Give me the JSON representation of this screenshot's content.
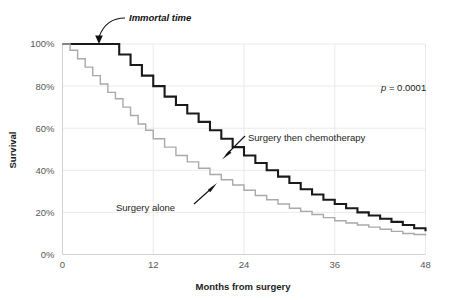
{
  "chart_data": {
    "type": "line",
    "subtype": "kaplan-meier-step",
    "title": "",
    "xlabel": "Months from surgery",
    "ylabel": "Survival",
    "xlim": [
      0,
      48
    ],
    "ylim": [
      0,
      100
    ],
    "xticks": [
      0,
      12,
      24,
      36,
      48
    ],
    "xtick_labels": [
      "0",
      "12",
      "24",
      "36",
      "48"
    ],
    "yticks": [
      0,
      20,
      40,
      60,
      80,
      100
    ],
    "ytick_labels": [
      "0%",
      "20%",
      "40%",
      "60%",
      "80%",
      "100%"
    ],
    "grid": true,
    "grid_color": "#e8e8e8",
    "legend_position": "inline-annotations",
    "annotations": [
      {
        "name": "immortal-time",
        "text": "Immortal time",
        "style": "bold-italic",
        "points_to_x": 3.2,
        "points_to_y": 100
      },
      {
        "name": "p-value",
        "text_italic": "p",
        "text_rest": " = 0.0001",
        "text_full": "p = 0.0001",
        "x": 36.5,
        "y": 84
      },
      {
        "name": "surgery-then-chemotherapy-label",
        "text": "Surgery then chemotherapy",
        "points_to_x": 20.5,
        "points_to_y": 47
      },
      {
        "name": "surgery-alone-label",
        "text": "Surgery alone",
        "points_to_x": 20.2,
        "points_to_y": 34
      }
    ],
    "series": [
      {
        "name": "Surgery then chemotherapy",
        "color": "#1a1a1a",
        "line_width": 2.1,
        "immortal_time_months": 6.5,
        "x": [
          0,
          1,
          2,
          3,
          4,
          5,
          6,
          6.5,
          7.5,
          9,
          10.5,
          12,
          13.5,
          15,
          16.5,
          18,
          19.5,
          21,
          22.5,
          24,
          25.5,
          27,
          28.5,
          30,
          31.5,
          33,
          34.5,
          36,
          37.5,
          39,
          40.5,
          42,
          43.5,
          45,
          46.5,
          48
        ],
        "values": [
          100,
          100,
          100,
          100,
          100,
          100,
          100,
          100,
          95,
          90,
          85,
          80,
          75,
          71,
          67,
          63,
          59,
          55,
          51,
          47,
          43.5,
          40,
          37,
          34,
          31,
          28.5,
          26,
          24,
          22,
          20,
          18.5,
          17,
          15.5,
          14,
          12.5,
          11
        ]
      },
      {
        "name": "Surgery alone",
        "color": "#a9a9a9",
        "line_width": 1.4,
        "immortal_time_months": 0,
        "x": [
          0,
          1,
          2,
          3,
          4,
          5,
          6,
          7,
          8,
          9,
          10,
          11,
          12,
          13.5,
          15,
          16.5,
          18,
          19.5,
          21,
          22.5,
          24,
          25.5,
          27,
          28.5,
          30,
          31.5,
          33,
          34.5,
          36,
          37.5,
          39,
          40.5,
          42,
          43.5,
          45,
          46.5,
          48
        ],
        "values": [
          100,
          97,
          93,
          89,
          85,
          81,
          77,
          74,
          70,
          66,
          62,
          59,
          55,
          51,
          47,
          44,
          41,
          38,
          35.5,
          33,
          30.5,
          28,
          26,
          24,
          22,
          20.5,
          19,
          17.5,
          16,
          15,
          14,
          13,
          12,
          11,
          10,
          9.5,
          9
        ]
      }
    ]
  },
  "axes": {
    "ylabel": "Survival",
    "xlabel": "Months from surgery",
    "ytick_labels": [
      "100%",
      "80%",
      "60%",
      "40%",
      "20%",
      "0%"
    ],
    "xtick_labels": [
      "0",
      "12",
      "24",
      "36",
      "48"
    ]
  },
  "labels": {
    "immortal_time": "Immortal time",
    "p_value_italic": "p",
    "p_value_rest": " = 0.0001",
    "surgery_then_chemo": "Surgery then chemotherapy",
    "surgery_alone": "Surgery alone"
  },
  "colors": {
    "background": "#ffffff",
    "grid": "#e8e8e8",
    "axis_text": "#585858",
    "dark_curve": "#1a1a1a",
    "light_curve": "#a9a9a9",
    "annotation_text": "#111111"
  }
}
